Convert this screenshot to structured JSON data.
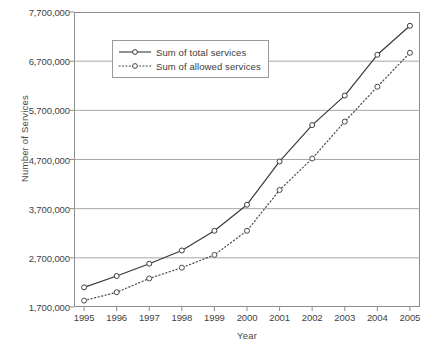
{
  "chart_data": {
    "type": "line",
    "title": "",
    "xlabel": "Year",
    "ylabel": "Number of Services",
    "categories": [
      1995,
      1996,
      1997,
      1998,
      1999,
      2000,
      2001,
      2002,
      2003,
      2004,
      2005
    ],
    "x_tick_labels": [
      "1995",
      "1996",
      "1997",
      "1998",
      "1999",
      "2000",
      "2001",
      "2002",
      "2003",
      "2004",
      "2005"
    ],
    "y_tick_values": [
      1700000,
      2700000,
      3700000,
      4700000,
      5700000,
      6700000,
      7700000
    ],
    "y_tick_labels": [
      "1,700,000",
      "2,700,000",
      "3,700,000",
      "4,700,000",
      "5,700,000",
      "6,700,000",
      "7,700,000"
    ],
    "ylim": [
      1700000,
      7700000
    ],
    "xlim": [
      1995,
      2005
    ],
    "grid": "horizontal",
    "legend_position": "upper-left-inside",
    "series": [
      {
        "name": "Sum of total services",
        "line_style": "solid",
        "marker": "open-circle",
        "color": "#3a3a3a",
        "values": [
          2100000,
          2330000,
          2580000,
          2850000,
          3250000,
          3780000,
          4660000,
          5400000,
          6000000,
          6830000,
          7420000
        ]
      },
      {
        "name": "Sum of allowed services",
        "line_style": "dotted",
        "marker": "open-circle",
        "color": "#4a4a4a",
        "values": [
          1830000,
          2000000,
          2280000,
          2500000,
          2760000,
          3250000,
          4080000,
          4720000,
          5470000,
          6180000,
          6870000
        ]
      }
    ]
  },
  "legend": {
    "items": [
      {
        "label": "Sum of total services"
      },
      {
        "label": "Sum of allowed services"
      }
    ]
  },
  "colors": {
    "axis": "#8d8d8d",
    "grid": "#a8a8a8",
    "text": "#3a3a3a",
    "series_total": "#3a3a3a",
    "series_allowed": "#4a4a4a",
    "background": "#ffffff"
  }
}
